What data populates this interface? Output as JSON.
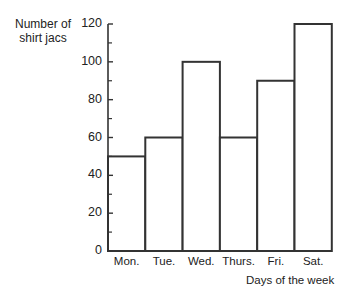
{
  "chart_data": {
    "type": "bar",
    "title": "",
    "ylabel": "Number of shirt jacs",
    "ylabel_lines": [
      "Number of",
      "shirt jacs"
    ],
    "xlabel": "Days of the week",
    "categories": [
      "Mon.",
      "Tue.",
      "Wed.",
      "Thurs.",
      "Fri.",
      "Sat."
    ],
    "values": [
      50,
      60,
      100,
      60,
      90,
      120
    ],
    "ylim": [
      0,
      120
    ],
    "yticks": [
      0,
      20,
      40,
      60,
      80,
      100,
      120
    ],
    "minor_ticks": [
      10,
      30,
      50,
      70,
      90,
      110
    ],
    "grid": false,
    "legend": null,
    "bar_fill": "#ffffff",
    "bar_stroke": "#333333"
  }
}
